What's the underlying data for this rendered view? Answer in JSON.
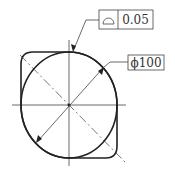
{
  "drawing": {
    "title": "Profile of a line tolerance on circular feature",
    "feature_control_frame": {
      "symbol": "profile-of-line",
      "symbol_glyph": "⌓",
      "tolerance": "0.05"
    },
    "diameter_dimension": {
      "prefix": "ϕ",
      "value": "100",
      "label": "ϕ100"
    },
    "colors": {
      "line": "#222222",
      "thin_line": "#444444",
      "background": "#ffffff"
    }
  }
}
